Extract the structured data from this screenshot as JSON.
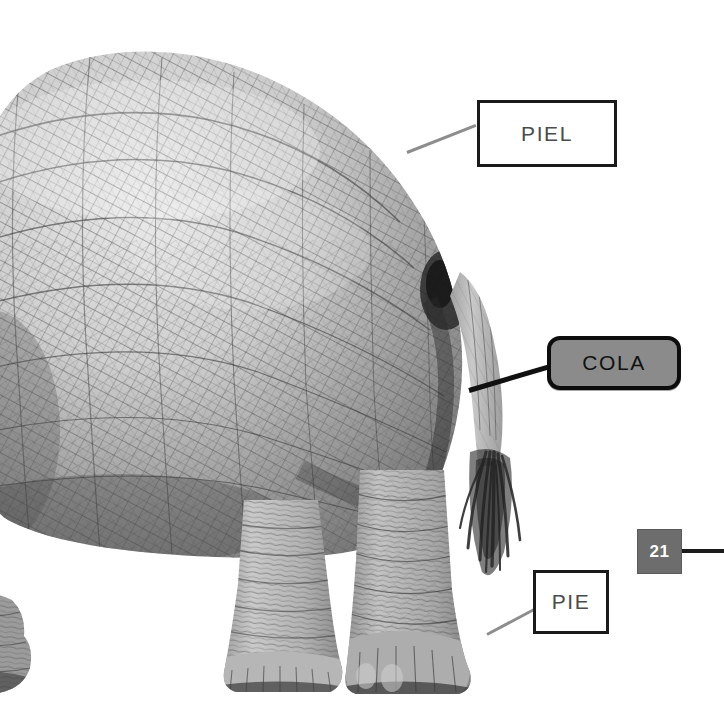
{
  "diagram": {
    "language": "es",
    "background_color": "#ffffff",
    "labels": [
      {
        "id": "piel",
        "text": "PIEL",
        "style": "plain-box",
        "box_fill": "#ffffff",
        "border_color": "#1a1a1a",
        "text_color": "#4b4b4b",
        "connector_color": "#8d8d8d"
      },
      {
        "id": "cola",
        "text": "COLA",
        "style": "rounded-pill",
        "box_fill": "#8b8b8b",
        "border_color": "#0d0d0d",
        "text_color": "#111111",
        "connector_color": "#111111"
      },
      {
        "id": "pie",
        "text": "PIE",
        "style": "plain-box",
        "box_fill": "#ffffff",
        "border_color": "#1a1a1a",
        "text_color": "#4b4b4b",
        "connector_color": "#8d8d8d"
      }
    ],
    "badge": {
      "id": "badge-21",
      "text": "21",
      "fill": "#6d6d6d",
      "text_color": "#ffffff",
      "connector_color": "#1b1b1b"
    }
  }
}
